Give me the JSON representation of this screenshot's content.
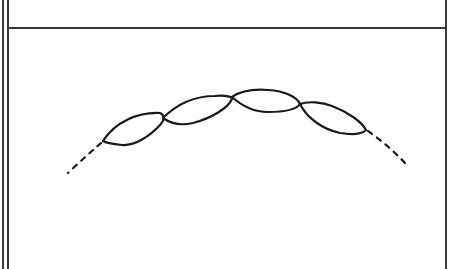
{
  "figure": {
    "colors": {
      "background": "#ffffff",
      "stroke": "#1a1a1a",
      "frame": "#3a3a3a"
    },
    "frame": {
      "left_double_border": true,
      "right_border": true,
      "top_rule_y": 28
    },
    "loops": [
      {
        "id": 1,
        "left": [
          103,
          141
        ],
        "right": [
          163,
          118
        ]
      },
      {
        "id": 2,
        "left": [
          163,
          118
        ],
        "right": [
          232,
          97
        ]
      },
      {
        "id": 3,
        "left": [
          232,
          97
        ],
        "right": [
          300,
          104
        ]
      },
      {
        "id": 4,
        "left": [
          300,
          104
        ],
        "right": [
          366,
          130
        ]
      }
    ],
    "dashed_extensions": [
      {
        "side": "left",
        "from": [
          101,
          143
        ],
        "to": [
          68,
          173
        ]
      },
      {
        "side": "right",
        "from": [
          368,
          131
        ],
        "to": [
          405,
          163
        ]
      }
    ]
  }
}
